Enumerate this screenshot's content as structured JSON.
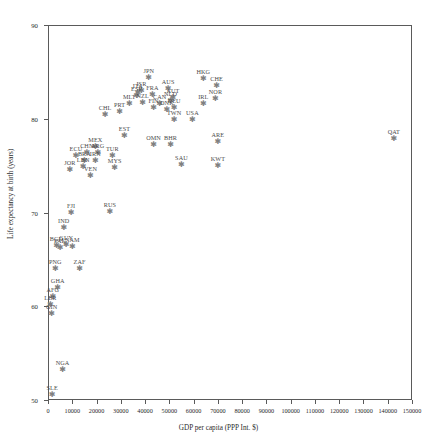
{
  "chart_data": {
    "type": "scatter",
    "title": "",
    "xlabel": "GDP per capita (PPP Int. $)",
    "ylabel": "Life expectancy at birth (years)",
    "xlim": [
      0,
      150000
    ],
    "ylim": [
      50,
      90
    ],
    "xticks": [
      0,
      10000,
      20000,
      30000,
      40000,
      50000,
      60000,
      70000,
      80000,
      90000,
      100000,
      110000,
      120000,
      130000,
      140000,
      150000
    ],
    "xticklabels": [
      "0",
      "10000",
      "20000",
      "30000",
      "40000",
      "50000",
      "60000",
      "70000",
      "80000",
      "90000",
      "100000",
      "110000",
      "120000",
      "130000",
      "140000",
      "150000"
    ],
    "yticks": [
      50,
      60,
      70,
      80,
      90
    ],
    "yticklabels": [
      "50",
      "60",
      "70",
      "80",
      "90"
    ],
    "grid": false,
    "legend": null,
    "marker": "star",
    "marker_color": "#808080",
    "label_color": "#4a4a4a",
    "points": [
      {
        "label": "JPN",
        "x": 41500,
        "y": 84.3
      },
      {
        "label": "HKG",
        "x": 64000,
        "y": 84.2
      },
      {
        "label": "CHE",
        "x": 69500,
        "y": 83.5
      },
      {
        "label": "ISR",
        "x": 38500,
        "y": 83.0
      },
      {
        "label": "AUS",
        "x": 49500,
        "y": 83.2
      },
      {
        "label": "ITA",
        "x": 37000,
        "y": 82.8
      },
      {
        "label": "ESP",
        "x": 36500,
        "y": 82.4
      },
      {
        "label": "FRA",
        "x": 43000,
        "y": 82.5
      },
      {
        "label": "AUT",
        "x": 51500,
        "y": 82.2
      },
      {
        "label": "NOR",
        "x": 69000,
        "y": 82.1
      },
      {
        "label": "NLD",
        "x": 50500,
        "y": 81.9
      },
      {
        "label": "CHL",
        "x": 23500,
        "y": 80.4
      },
      {
        "label": "MLT",
        "x": 33500,
        "y": 81.6
      },
      {
        "label": "NZL",
        "x": 39000,
        "y": 81.7
      },
      {
        "label": "CAN",
        "x": 46000,
        "y": 81.6
      },
      {
        "label": "DEU",
        "x": 52000,
        "y": 81.2
      },
      {
        "label": "IRL",
        "x": 64000,
        "y": 81.6
      },
      {
        "label": "PRT",
        "x": 29500,
        "y": 80.7
      },
      {
        "label": "FIN",
        "x": 43500,
        "y": 81.1
      },
      {
        "label": "DNK",
        "x": 49000,
        "y": 80.9
      },
      {
        "label": "TWN",
        "x": 52000,
        "y": 79.9
      },
      {
        "label": "USA",
        "x": 59500,
        "y": 79.9
      },
      {
        "label": "EST",
        "x": 31500,
        "y": 78.2
      },
      {
        "label": "ARE",
        "x": 70000,
        "y": 77.5
      },
      {
        "label": "QAT",
        "x": 142500,
        "y": 77.8
      },
      {
        "label": "OMN",
        "x": 43500,
        "y": 77.2
      },
      {
        "label": "BHR",
        "x": 50500,
        "y": 77.2
      },
      {
        "label": "MEX",
        "x": 19500,
        "y": 77.0
      },
      {
        "label": "CHN",
        "x": 16000,
        "y": 76.3
      },
      {
        "label": "ARG",
        "x": 20500,
        "y": 76.3
      },
      {
        "label": "ECU",
        "x": 11500,
        "y": 76.0
      },
      {
        "label": "TUR",
        "x": 26500,
        "y": 76.0
      },
      {
        "label": "BRA",
        "x": 15000,
        "y": 75.5
      },
      {
        "label": "IRN",
        "x": 19500,
        "y": 75.5
      },
      {
        "label": "SAU",
        "x": 55000,
        "y": 75.1
      },
      {
        "label": "KWT",
        "x": 70000,
        "y": 75.0
      },
      {
        "label": "JOR",
        "x": 9000,
        "y": 74.5
      },
      {
        "label": "LBN",
        "x": 14500,
        "y": 74.9
      },
      {
        "label": "MYS",
        "x": 27500,
        "y": 74.7
      },
      {
        "label": "VEN",
        "x": 17500,
        "y": 73.9
      },
      {
        "label": "FJI",
        "x": 9500,
        "y": 70.0
      },
      {
        "label": "RUS",
        "x": 25500,
        "y": 70.1
      },
      {
        "label": "IND",
        "x": 6500,
        "y": 68.3
      },
      {
        "label": "GUY",
        "x": 7500,
        "y": 66.5
      },
      {
        "label": "NAM",
        "x": 10000,
        "y": 66.3
      },
      {
        "label": "PAK",
        "x": 5000,
        "y": 66.2
      },
      {
        "label": "BGD",
        "x": 3500,
        "y": 66.4
      },
      {
        "label": "ZAF",
        "x": 13000,
        "y": 64.0
      },
      {
        "label": "PNG",
        "x": 3000,
        "y": 64.0
      },
      {
        "label": "GHA",
        "x": 4000,
        "y": 62.0
      },
      {
        "label": "AFG",
        "x": 2000,
        "y": 61.0
      },
      {
        "label": "LBR",
        "x": 1000,
        "y": 60.1
      },
      {
        "label": "GIN",
        "x": 1500,
        "y": 59.2
      },
      {
        "label": "NGA",
        "x": 6000,
        "y": 53.2
      },
      {
        "label": "SLE",
        "x": 1700,
        "y": 50.5
      }
    ]
  }
}
